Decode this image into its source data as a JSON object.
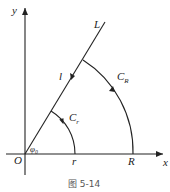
{
  "figure": {
    "caption": "图 5-14",
    "axes": {
      "x_label": "x",
      "y_label": "y",
      "origin_label": "O"
    },
    "ray_label": "L",
    "segment_label": "l",
    "angle_label": "φ₀",
    "small_radius_label": "r",
    "large_radius_label": "R",
    "small_arc_label": "C",
    "small_arc_sub": "r",
    "large_arc_label": "C",
    "large_arc_sub": "R"
  }
}
